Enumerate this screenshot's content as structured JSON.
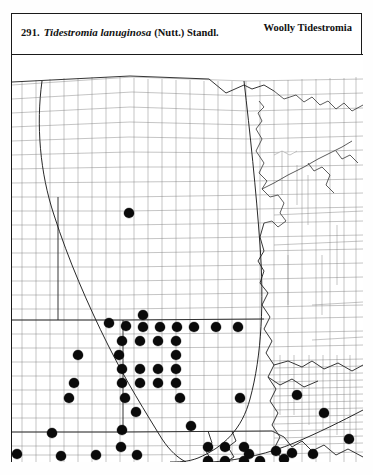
{
  "page": {
    "entry_number": "291.",
    "scientific_name": "Tidestromia lanuginosa",
    "authority": "(Nutt.) Standl.",
    "common_name": "Woolly Tidestromia",
    "frame_color": "#1a1a1a",
    "dot_color": "#0a0a0a",
    "county_line_color": "#7d7d7d",
    "state_line_color": "#2b2b2b"
  },
  "map": {
    "title": "county-level distribution map",
    "region": "Great Plains",
    "dot_legend": "filled circle = documented county record",
    "dot_count": 97,
    "range_boundary_label": "range boundary line"
  },
  "chart_data": {
    "type": "scatter",
    "xlabel": "",
    "ylabel": "",
    "xlim": [
      0,
      351
    ],
    "ylim": [
      0,
      407
    ],
    "grid": false,
    "legend": "none",
    "series": [
      {
        "name": "county records",
        "points": [
          [
            117,
            158
          ],
          [
            97,
            268
          ],
          [
            131,
            260
          ],
          [
            114,
            271
          ],
          [
            131,
            272
          ],
          [
            148,
            272
          ],
          [
            165,
            272
          ],
          [
            182,
            272
          ],
          [
            204,
            272
          ],
          [
            226,
            272
          ],
          [
            110,
            286
          ],
          [
            128,
            286
          ],
          [
            146,
            286
          ],
          [
            164,
            286
          ],
          [
            66,
            300
          ],
          [
            107,
            300
          ],
          [
            164,
            300
          ],
          [
            110,
            314
          ],
          [
            128,
            314
          ],
          [
            146,
            314
          ],
          [
            164,
            314
          ],
          [
            62,
            328
          ],
          [
            110,
            328
          ],
          [
            128,
            328
          ],
          [
            146,
            328
          ],
          [
            164,
            328
          ],
          [
            57,
            343
          ],
          [
            113,
            343
          ],
          [
            168,
            343
          ],
          [
            228,
            343
          ],
          [
            124,
            357
          ],
          [
            179,
            371
          ],
          [
            40,
            378
          ],
          [
            110,
            375
          ],
          [
            109,
            392
          ],
          [
            5,
            399
          ],
          [
            49,
            401
          ],
          [
            84,
            400
          ],
          [
            125,
            400
          ],
          [
            237,
            399
          ],
          [
            285,
            340
          ],
          [
            312,
            358
          ],
          [
            337,
            384
          ],
          [
            301,
            399
          ],
          [
            196,
            392
          ],
          [
            213,
            392
          ],
          [
            232,
            392
          ],
          [
            196,
            406
          ],
          [
            213,
            406
          ],
          [
            232,
            406
          ],
          [
            248,
            406
          ],
          [
            264,
            396
          ],
          [
            272,
            404
          ],
          [
            280,
            398
          ]
        ]
      }
    ]
  }
}
